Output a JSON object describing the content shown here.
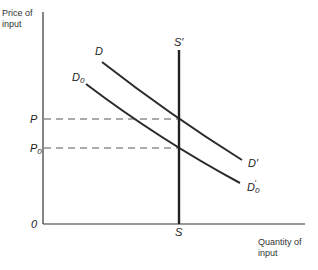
{
  "axes": {
    "y_label_line1": "Price of",
    "y_label_line2": "input",
    "x_label_line1": "Quantity of",
    "x_label_line2": "input",
    "origin": "0"
  },
  "price_levels": [
    {
      "label": "P",
      "sub": "",
      "y": 119
    },
    {
      "label": "P",
      "sub": "0",
      "y": 148
    }
  ],
  "curves": {
    "D": {
      "label": "D",
      "end_label": "D",
      "end_prime": "′"
    },
    "D0": {
      "label": "D",
      "label_sub": "0",
      "end_label": "D",
      "end_sub": "0",
      "end_prime": "′"
    }
  },
  "supply": {
    "top_label": "S′",
    "bottom_label": "S"
  },
  "colors": {
    "ink": "#2b2b2b",
    "dash": "#555555"
  }
}
